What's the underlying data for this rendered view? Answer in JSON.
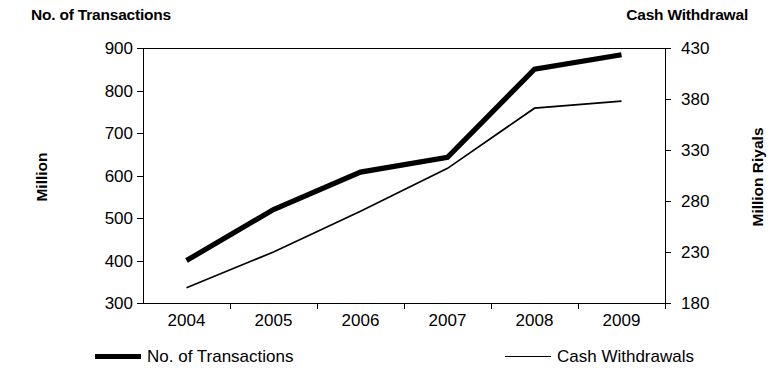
{
  "titles": {
    "left": "No. of Transactions",
    "right": "Cash Withdrawal"
  },
  "chart_data": {
    "type": "line",
    "title": "",
    "xlabel": "",
    "categories": [
      "2004",
      "2005",
      "2006",
      "2007",
      "2008",
      "2009"
    ],
    "grid": false,
    "legend_position": "bottom",
    "axes": {
      "left": {
        "name": "Million",
        "title": "No. of Transactions",
        "ticks": [
          300,
          400,
          500,
          600,
          700,
          800,
          900
        ],
        "ylim": [
          300,
          900
        ]
      },
      "right": {
        "name": "Million Riyals",
        "title": "Cash Withdrawal",
        "ticks": [
          180,
          230,
          280,
          330,
          380,
          430
        ],
        "ylim": [
          180,
          430
        ]
      }
    },
    "series": [
      {
        "name": "No. of Transactions",
        "axis": "left",
        "style": "thick",
        "color": "#000000",
        "values": [
          400,
          520,
          608,
          643,
          850,
          884
        ]
      },
      {
        "name": "Cash Withdrawals",
        "axis": "right",
        "style": "thin",
        "color": "#000000",
        "values": [
          195,
          230,
          270,
          312,
          371,
          378
        ]
      }
    ]
  },
  "legend": [
    {
      "label": "No. of Transactions",
      "style": "thick"
    },
    {
      "label": "Cash Withdrawals",
      "style": "thin"
    }
  ]
}
